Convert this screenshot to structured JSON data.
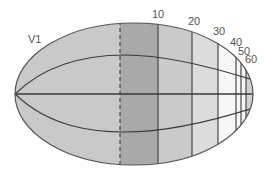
{
  "title": "V1",
  "region_label": "V1",
  "eccentricity_labels": [
    {
      "text": "10",
      "x": 152,
      "y": 18
    },
    {
      "text": "20",
      "x": 188,
      "y": 25
    },
    {
      "text": "30",
      "x": 213,
      "y": 35
    },
    {
      "text": "40",
      "x": 230,
      "y": 46
    },
    {
      "text": "50",
      "x": 238,
      "y": 55
    },
    {
      "text": "60",
      "x": 245,
      "y": 63
    }
  ],
  "bands": [
    {
      "x0": 0,
      "x1": 120,
      "color": "#c9c9c9"
    },
    {
      "x0": 120,
      "x1": 158,
      "color": "#a9a9a9"
    },
    {
      "x0": 158,
      "x1": 192,
      "color": "#cacaca"
    },
    {
      "x0": 192,
      "x1": 218,
      "color": "#dcdcdc"
    },
    {
      "x0": 218,
      "x1": 246,
      "color": "#f7f7f7"
    },
    {
      "x0": 246,
      "x1": 265,
      "color": "#d2d2d2"
    }
  ],
  "vertical_lines": [
    {
      "x": 120,
      "style": "dashed",
      "meaning": "fovea"
    },
    {
      "x": 158,
      "style": "solid",
      "label": "10"
    },
    {
      "x": 192,
      "style": "solid",
      "label": "20"
    },
    {
      "x": 218,
      "style": "solid",
      "label": "30"
    },
    {
      "x": 236,
      "style": "solid",
      "label": "40"
    },
    {
      "x": 241,
      "style": "solid",
      "label": "50"
    },
    {
      "x": 246,
      "style": "solid",
      "label": "60"
    }
  ],
  "colors": {
    "outline": "#555555",
    "grid_line": "#3a3a3a",
    "label": "#555555"
  }
}
